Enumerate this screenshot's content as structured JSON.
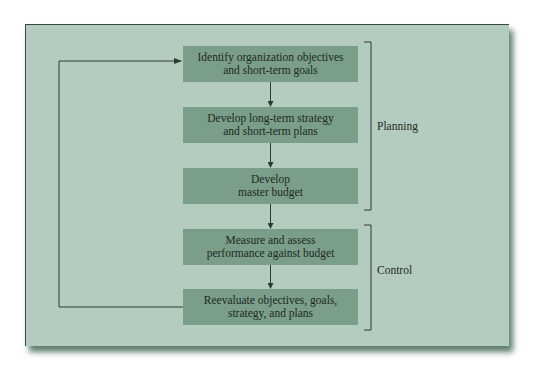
{
  "diagram": {
    "steps": [
      {
        "line1": "Identify organization objectives",
        "line2": "and short-term goals"
      },
      {
        "line1": "Develop long-term strategy",
        "line2": "and short-term plans"
      },
      {
        "line1": "Develop",
        "line2": "master budget"
      },
      {
        "line1": "Measure and assess",
        "line2": "performance against budget"
      },
      {
        "line1": "Reevaluate objectives, goals,",
        "line2": "strategy, and plans"
      }
    ],
    "groups": {
      "planning": "Planning",
      "control": "Control"
    },
    "colors": {
      "panel_background": "#b4cbbf",
      "box_fill": "#7a9e89",
      "line": "#2e3a34"
    }
  }
}
